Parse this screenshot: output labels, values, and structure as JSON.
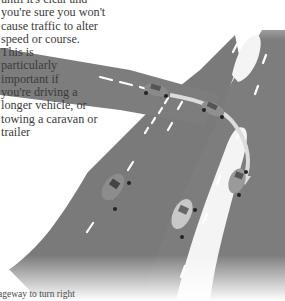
{
  "body_text": {
    "lines": [
      "until it's clear and",
      "you're sure you won't",
      "cause traffic to alter",
      "speed or course.",
      "This is",
      "particularly",
      "important if",
      "you're driving a",
      "longer vehicle, or",
      "towing a caravan or",
      "trailer"
    ]
  },
  "caption": {
    "text": "ageway to turn right"
  },
  "illustration": {
    "subject": "dual carriageway right turn through central reservation gap",
    "road_color": "#7d7d7d",
    "marking_color": "#ffffff",
    "path_color": "#d9d9d9",
    "cars": [
      {
        "label": "car-waiting-at-junction",
        "color": "#8a8a8a"
      },
      {
        "label": "car-crossing-reservation",
        "color": "#8f8f8f"
      },
      {
        "label": "car-turned-right",
        "color": "#9a9a9a"
      },
      {
        "label": "car-left-carriageway",
        "color": "#8c8c8c"
      },
      {
        "label": "car-right-carriageway-light",
        "color": "#c8c8c8"
      }
    ]
  }
}
